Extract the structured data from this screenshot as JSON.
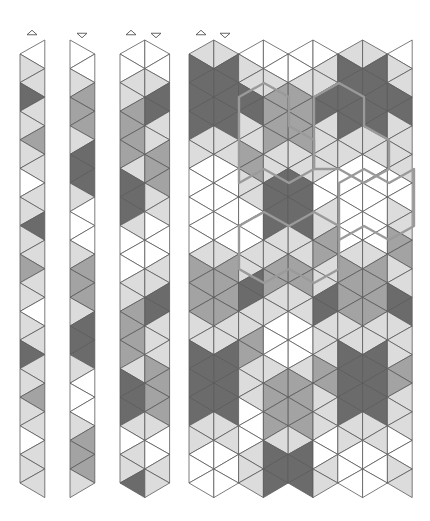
{
  "figure": {
    "palette": {
      "W": "#ffffff",
      "L": "#dcdcdc",
      "M": "#a3a3a3",
      "D": "#6b6b6b",
      "line": "#5a5a5a",
      "highlight": "#9a9a9a"
    },
    "geometry": {
      "column_width": 24.8,
      "half_step": 14.3,
      "triangles_per_column": 31,
      "top_low_y": 54,
      "top_high_y": 40
    }
  },
  "strips": [
    {
      "name": "strip-1",
      "x0": 20,
      "start": "low-left",
      "columns": [
        "WLLDLLMLLWLLDLLMLLWLLDLLMLLWLLL"
      ]
    },
    {
      "name": "strip-2",
      "x0": 70,
      "start": "high-left",
      "columns": [
        "WWLMMMLDDDLWWWLMMMLDDDLWWWLMMMLD"
      ]
    },
    {
      "name": "strip-3",
      "x0": 120,
      "start": "low-left",
      "columns": [
        "WWLLMMMMLDDDLWWWLLMMMMLDDDLWLLDD",
        "WWLDDLLMMMLLWWWLLDDLLLMMMMLWWLLL"
      ]
    },
    {
      "name": "panel",
      "x0": 189,
      "start": "low-left",
      "columns": [
        "LDDDDDLLWWWWWWLMMMMLLDDDDDLLWWW",
        "LDDDDDLLWWWWWWLMMMMLLDDDDDLLWWW",
        "WLLDDLLMMLLWWWLLDDLLMMLLLWWWLLL",
        "WWLMMMMLLDDDDLLMMLLWWWLMMMMLDDD",
        "WWLMMMMLLDDDDLLMMLLWWWLMMMMLDDD",
        "WLLDDLLLLWWLLMMLLDDLLLMMLLLWWLL",
        "LDDDDDLLWWWWWWLMMMMLLDDDDDLLWWW",
        "LDDDDDLLWWWWWWLMMMMLLDDDDDLLWWW",
        "WLLDDLLLLWWLLMMLLDDLLLMMLLLWWLL"
      ]
    }
  ],
  "markers": [
    {
      "x": 32,
      "y": 33,
      "dir": "up"
    },
    {
      "x": 82,
      "y": 35,
      "dir": "down"
    },
    {
      "x": 131,
      "y": 33,
      "dir": "up"
    },
    {
      "x": 156,
      "y": 35,
      "dir": "down"
    },
    {
      "x": 201,
      "y": 33,
      "dir": "up"
    },
    {
      "x": 225,
      "y": 35,
      "dir": "down"
    }
  ],
  "highlights": [
    {
      "points": "239,97 264,83 289,97 289,126 314,140 314,169 289,183 264,169 239,183 239,126"
    },
    {
      "points": "314,97 339,83 364,97 364,126 389,140 389,169 364,183 339,169 314,169"
    },
    {
      "points": "339,183 364,169 389,183 414,169 414,226 389,240 364,226 339,240"
    },
    {
      "points": "239,226 264,212 289,226 314,212 339,226 339,269 314,283 289,269 264,283 239,269"
    }
  ]
}
